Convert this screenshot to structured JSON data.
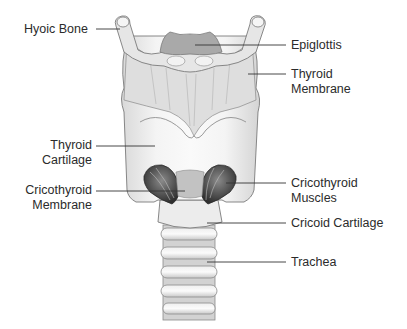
{
  "diagram": {
    "labels": {
      "hyoid_bone": "Hyoic Bone",
      "epiglottis": "Epiglottis",
      "thyroid_membrane_1": "Thyroid",
      "thyroid_membrane_2": "Membrane",
      "thyroid_cartilage_1": "Thyroid",
      "thyroid_cartilage_2": "Cartilage",
      "cricothyroid_membrane_1": "Cricothyroid",
      "cricothyroid_membrane_2": "Membrane",
      "cricothyroid_muscles_1": "Cricothyroid",
      "cricothyroid_muscles_2": "Muscles",
      "cricoid_cartilage": "Cricoid Cartilage",
      "trachea": "Trachea"
    },
    "colors": {
      "background": "#ffffff",
      "cartilage_light": "#f1f1f1",
      "cartilage_mid": "#d6d6d6",
      "outline": "#7a7a7a",
      "epiglottis": "#a9a9a9",
      "muscle_dark": "#3c3c3c",
      "leader_line": "#333333",
      "text": "#2b2b2b"
    }
  }
}
